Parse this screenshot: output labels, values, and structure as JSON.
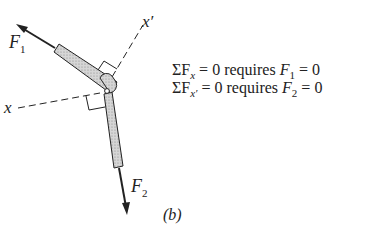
{
  "figure": {
    "labels": {
      "force_1": "F",
      "force_1_sub": "1",
      "force_2": "F",
      "force_2_sub": "2",
      "axis_x": "x",
      "axis_x_prime": "x′",
      "caption": "(b)"
    },
    "equations": [
      {
        "sum": "ΣF",
        "sub": "x",
        "rest": " = 0 requires ",
        "var": "F",
        "var_sub": "1",
        "end": " = 0"
      },
      {
        "sum": "ΣF",
        "sub": "x′",
        "rest": " = 0 requires ",
        "var": "F",
        "var_sub": "2",
        "end": " = 0"
      }
    ],
    "colors": {
      "ink": "#222222",
      "member_fill": "#c8c8c8",
      "background": "#ffffff"
    }
  }
}
